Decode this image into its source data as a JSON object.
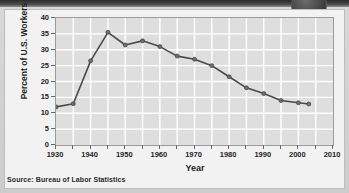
{
  "figure": {
    "badge_label": "",
    "source_note": "Source: Bureau of Labor Statistics"
  },
  "chart_data": {
    "type": "line",
    "title": "",
    "subtitle": "",
    "xlabel": "Year",
    "ylabel": "Percent of U.S. Workers",
    "xlim": [
      1930,
      2010
    ],
    "ylim": [
      0,
      40
    ],
    "x_ticks": [
      1930,
      1940,
      1950,
      1960,
      1970,
      1980,
      1990,
      2000,
      2010
    ],
    "x_tick_labels": [
      "1930",
      "1940",
      "1950",
      "1960",
      "1970",
      "1980",
      "1990",
      "2000",
      "2010"
    ],
    "x_minor_ticks": [
      1935,
      1945,
      1955,
      1965,
      1975,
      1985,
      1995,
      2005
    ],
    "y_ticks": [
      0,
      5,
      10,
      15,
      20,
      25,
      30,
      35,
      40
    ],
    "y_tick_labels": [
      "0",
      "5",
      "10",
      "15",
      "20",
      "25",
      "30",
      "35",
      "40"
    ],
    "grid": true,
    "grid_color": "#ffffff",
    "plot_background": "#dedede",
    "legend": null,
    "legend_position": "none",
    "series": [
      {
        "name": "Percent of U.S. Workers in Unions",
        "color": "#4a4a4a",
        "marker": "circle",
        "marker_color": "#6e6e6e",
        "x": [
          1930,
          1935,
          1940,
          1945,
          1950,
          1955,
          1960,
          1965,
          1970,
          1975,
          1980,
          1985,
          1990,
          1995,
          2000,
          2003
        ],
        "values": [
          12.0,
          13.0,
          26.5,
          35.5,
          31.5,
          32.8,
          31.0,
          28.0,
          27.0,
          25.0,
          21.5,
          18.0,
          16.2,
          14.0,
          13.3,
          12.9
        ]
      }
    ]
  }
}
